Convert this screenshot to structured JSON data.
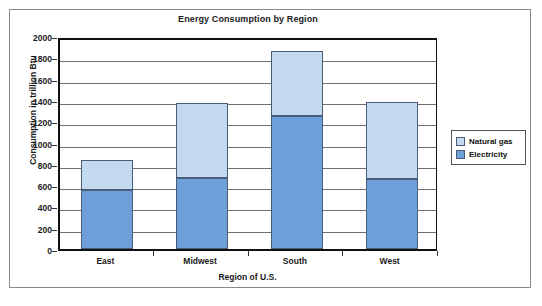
{
  "chart_data": {
    "type": "bar",
    "title": "Energy Consumption by Region",
    "xlabel": "Region of U.S.",
    "ylabel": "Consumption in trillion Btu",
    "categories": [
      "East",
      "Midwest",
      "South",
      "West"
    ],
    "series": [
      {
        "name": "Electricity",
        "color": "#6f9fd8",
        "values": [
          550,
          670,
          1250,
          655
        ]
      },
      {
        "name": "Natural gas",
        "color": "#c3d9ef",
        "values": [
          290,
          700,
          610,
          725
        ]
      }
    ],
    "totals": [
      840,
      1370,
      1860,
      1380
    ],
    "stacked": true,
    "ylim": [
      0,
      2000
    ],
    "ytick_values": [
      0,
      200,
      400,
      600,
      800,
      1000,
      1200,
      1400,
      1600,
      1800,
      2000
    ],
    "ytick_labels": [
      "0",
      "200",
      "400",
      "600",
      "800",
      "1000",
      "1200",
      "1400",
      "1600",
      "1800",
      "2000"
    ],
    "grid": true,
    "legend_position": "right",
    "legend_entries": [
      "Natural gas",
      "Electricity"
    ]
  },
  "legend": {
    "items": [
      {
        "label": "Natural gas",
        "color": "#c3d9ef",
        "swatch_icon": "legend-swatch-icon"
      },
      {
        "label": "Electricity",
        "color": "#6f9fd8",
        "swatch_icon": "legend-swatch-icon"
      }
    ]
  }
}
